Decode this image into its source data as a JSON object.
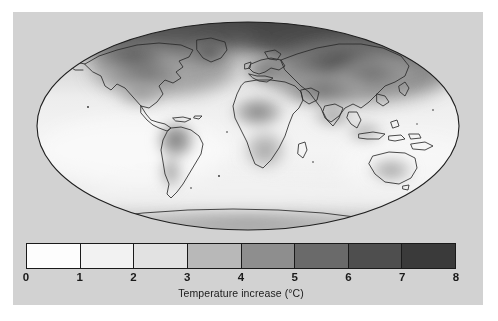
{
  "figure": {
    "type": "world-map-choropleth",
    "projection": "Mollweide",
    "panel_background": "#d2d2d2",
    "page_background": "#ffffff"
  },
  "map": {
    "name": "global-temperature-increase-map",
    "outline_color": "#2b2b2b",
    "ocean_base_color": "#f4f4f4",
    "description": "Mollweide projection world map shaded by projected temperature increase"
  },
  "chart_data": {
    "type": "heatmap",
    "title": "",
    "xlabel": "",
    "ylabel": "",
    "colorbar": {
      "label": "Temperature increase (°C)",
      "units": "°C",
      "vmin": 0,
      "vmax": 8,
      "tick_labels": [
        "0",
        "1",
        "2",
        "3",
        "4",
        "5",
        "6",
        "7",
        "8"
      ],
      "tick_values": [
        0,
        1,
        2,
        3,
        4,
        5,
        6,
        7,
        8
      ],
      "segments": [
        {
          "range": "0-1",
          "color": "#fdfdfd"
        },
        {
          "range": "1-2",
          "color": "#f2f2f2"
        },
        {
          "range": "2-3",
          "color": "#e2e2e2"
        },
        {
          "range": "3-4",
          "color": "#b8b8b8"
        },
        {
          "range": "4-5",
          "color": "#8e8e8e"
        },
        {
          "range": "5-6",
          "color": "#6a6a6a"
        },
        {
          "range": "6-7",
          "color": "#4e4e4e"
        },
        {
          "range": "7-8",
          "color": "#3a3a3a"
        }
      ],
      "orientation": "horizontal",
      "position": "below-map"
    },
    "regions": [
      {
        "name": "Arctic Ocean / High Arctic",
        "value": 7.5
      },
      {
        "name": "Northern Siberia",
        "value": 6.5
      },
      {
        "name": "Northern Canada",
        "value": 6.0
      },
      {
        "name": "Greenland",
        "value": 5.5
      },
      {
        "name": "Central Asia",
        "value": 4.5
      },
      {
        "name": "Europe",
        "value": 4.0
      },
      {
        "name": "Continental United States",
        "value": 4.0
      },
      {
        "name": "Northern Africa",
        "value": 3.8
      },
      {
        "name": "Central Africa",
        "value": 3.2
      },
      {
        "name": "Southern Africa",
        "value": 3.2
      },
      {
        "name": "Amazon / South America",
        "value": 3.8
      },
      {
        "name": "Southern South America",
        "value": 2.5
      },
      {
        "name": "India / South Asia",
        "value": 3.2
      },
      {
        "name": "Australia",
        "value": 3.2
      },
      {
        "name": "Maritime Southeast Asia",
        "value": 2.5
      },
      {
        "name": "Antarctica",
        "value": 2.8
      },
      {
        "name": "Southern Ocean",
        "value": 1.2
      },
      {
        "name": "Tropical Pacific Ocean",
        "value": 1.8
      },
      {
        "name": "North Atlantic Ocean",
        "value": 1.5
      },
      {
        "name": "Equatorial Atlantic",
        "value": 1.8
      },
      {
        "name": "Indian Ocean",
        "value": 2.0
      },
      {
        "name": "North Pacific Ocean",
        "value": 2.2
      }
    ]
  }
}
